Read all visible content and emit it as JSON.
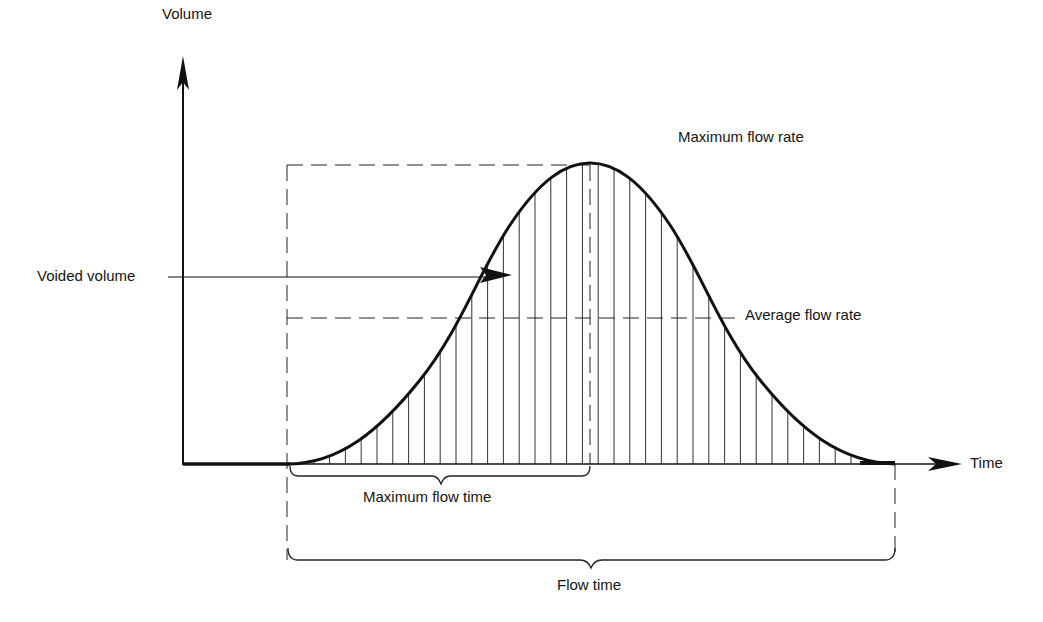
{
  "diagram": {
    "title": "",
    "type": "uroflow curve",
    "axes": {
      "y_label": "Volume",
      "x_label": "Time"
    },
    "labels": {
      "max_flow_rate": "Maximum flow rate",
      "voided_volume": "Voided volume",
      "average_flow_rate": "Average flow rate",
      "max_flow_time": "Maximum flow time",
      "flow_time": "Flow time"
    },
    "colors": {
      "ink": "#151515",
      "background": "#ffffff"
    }
  }
}
